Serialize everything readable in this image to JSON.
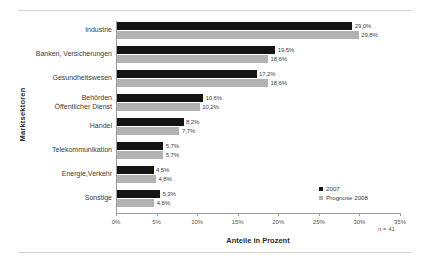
{
  "chart_data": {
    "type": "bar",
    "orientation": "horizontal",
    "title": "",
    "xlabel": "Anteile in Prozent",
    "ylabel": "Marktsektoren",
    "xlim": [
      0,
      35
    ],
    "xticks": [
      "0%",
      "5%",
      "10%",
      "15%",
      "20%",
      "25%",
      "30%",
      "35%"
    ],
    "xtick_values": [
      0,
      5,
      10,
      15,
      20,
      25,
      30,
      35
    ],
    "grid": false,
    "legend_position": "bottom-right",
    "categories": [
      "Industrie",
      "Banken, Versicherungen",
      "Gesundheitswesen",
      "Behörden\nÖffentlicher Dienst",
      "Handel",
      "Telekommunikation",
      "Energie,Verkehr",
      "Sonstige"
    ],
    "category_lines": [
      [
        "Industrie"
      ],
      [
        "Banken, Versicherungen"
      ],
      [
        "Gesundheitswesen"
      ],
      [
        "Behörden",
        "Öffentlicher Dienst"
      ],
      [
        "Handel"
      ],
      [
        "Telekommunikation"
      ],
      [
        "Energie,Verkehr"
      ],
      [
        "Sonstige"
      ]
    ],
    "series": [
      {
        "name": "2007",
        "color": "#141414",
        "values": [
          29.0,
          19.5,
          17.2,
          10.6,
          8.2,
          5.7,
          4.5,
          5.3
        ],
        "labels": [
          "29,0%",
          "19,5%",
          "17,2%",
          "10,6%",
          "8,2%",
          "5,7%",
          "4,5%",
          "5,3%"
        ]
      },
      {
        "name": "Prognose 2008",
        "color": "#b2b2b2",
        "values": [
          29.8,
          18.6,
          18.6,
          10.2,
          7.7,
          5.7,
          4.8,
          4.6
        ],
        "labels": [
          "29,8%",
          "18,6%",
          "18,6%",
          "10,2%",
          "7,7%",
          "5,7%",
          "4,8%",
          "4,6%"
        ]
      }
    ],
    "annotation": "n = 41"
  },
  "legend": {
    "items": [
      {
        "label": "2007",
        "color": "#141414"
      },
      {
        "label": "Prognose 2008",
        "color": "#b2b2b2"
      }
    ]
  }
}
